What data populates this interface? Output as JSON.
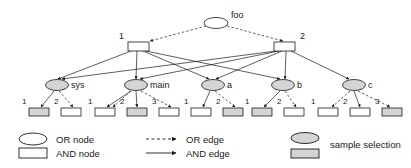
{
  "diagram": {
    "colors": {
      "stroke": "#1a1a1a",
      "node_fill": "#ffffff",
      "selected_fill": "#d4d4d4",
      "background": "#ffffff"
    },
    "root": {
      "label": "foo",
      "type": "or-node",
      "selected": false,
      "cx": 216,
      "cy": 23,
      "rx": 12,
      "ry": 5.5
    },
    "and_nodes": [
      {
        "label": "1",
        "type": "and-node",
        "selected": false,
        "x": 128,
        "y": 42,
        "w": 21,
        "h": 9,
        "label_x": 119,
        "label_y": 39
      },
      {
        "label": "2",
        "type": "and-node",
        "selected": false,
        "x": 274,
        "y": 42,
        "w": 21,
        "h": 9,
        "label_x": 300,
        "label_y": 39
      }
    ],
    "or_nodes": [
      {
        "label": "sys",
        "type": "or-node",
        "selected": true,
        "cx": 57,
        "cy": 85,
        "rx": 11.5,
        "ry": 5.5,
        "label_x": 71,
        "label_y": 88
      },
      {
        "label": "main",
        "type": "or-node",
        "selected": true,
        "cx": 136,
        "cy": 85,
        "rx": 11.5,
        "ry": 5.5,
        "label_x": 150,
        "label_y": 88
      },
      {
        "label": "a",
        "type": "or-node",
        "selected": true,
        "cx": 213,
        "cy": 85,
        "rx": 11.5,
        "ry": 5.5,
        "label_x": 227,
        "label_y": 88
      },
      {
        "label": "b",
        "type": "or-node",
        "selected": true,
        "cx": 283,
        "cy": 85,
        "rx": 11.5,
        "ry": 5.5,
        "label_x": 297,
        "label_y": 88
      },
      {
        "label": "c",
        "type": "or-node",
        "selected": true,
        "cx": 354,
        "cy": 85,
        "rx": 11.5,
        "ry": 5.5,
        "label_x": 368,
        "label_y": 88
      }
    ],
    "leaf_groups": [
      {
        "parent": "sys",
        "leaves": [
          {
            "label": "1",
            "selected": true,
            "x": 29,
            "y": 108,
            "w": 20,
            "h": 8,
            "label_x": 22,
            "label_y": 104
          },
          {
            "label": "2",
            "selected": false,
            "x": 61,
            "y": 108,
            "w": 20,
            "h": 8,
            "label_x": 54,
            "label_y": 104
          }
        ]
      },
      {
        "parent": "main",
        "leaves": [
          {
            "label": "1",
            "selected": false,
            "x": 95,
            "y": 108,
            "w": 20,
            "h": 8,
            "label_x": 88,
            "label_y": 104
          },
          {
            "label": "2",
            "selected": true,
            "x": 127,
            "y": 108,
            "w": 20,
            "h": 8,
            "label_x": 120,
            "label_y": 104
          },
          {
            "label": "3",
            "selected": false,
            "x": 159,
            "y": 108,
            "w": 20,
            "h": 8,
            "label_x": 152,
            "label_y": 104
          }
        ]
      },
      {
        "parent": "a",
        "leaves": [
          {
            "label": "1",
            "selected": false,
            "x": 191,
            "y": 108,
            "w": 20,
            "h": 8,
            "label_x": 184,
            "label_y": 104
          },
          {
            "label": "2",
            "selected": true,
            "x": 223,
            "y": 108,
            "w": 20,
            "h": 8,
            "label_x": 216,
            "label_y": 104
          }
        ]
      },
      {
        "parent": "b",
        "leaves": [
          {
            "label": "1",
            "selected": true,
            "x": 252,
            "y": 108,
            "w": 20,
            "h": 8,
            "label_x": 245,
            "label_y": 104
          },
          {
            "label": "2",
            "selected": false,
            "x": 284,
            "y": 108,
            "w": 20,
            "h": 8,
            "label_x": 277,
            "label_y": 104
          }
        ]
      },
      {
        "parent": "c",
        "leaves": [
          {
            "label": "1",
            "selected": false,
            "x": 318,
            "y": 108,
            "w": 20,
            "h": 8,
            "label_x": 311,
            "label_y": 104
          },
          {
            "label": "2",
            "selected": false,
            "x": 350,
            "y": 108,
            "w": 20,
            "h": 8,
            "label_x": 343,
            "label_y": 104
          },
          {
            "label": "3",
            "selected": true,
            "x": 382,
            "y": 108,
            "w": 20,
            "h": 8,
            "label_x": 375,
            "label_y": 104
          }
        ]
      }
    ],
    "edges": {
      "or_edges": [
        {
          "from": "foo",
          "to": "and-1",
          "x1": 206,
          "y1": 26,
          "x2": 150,
          "y2": 41
        },
        {
          "from": "foo",
          "to": "and-2",
          "x1": 227,
          "y1": 26,
          "x2": 283,
          "y2": 41
        },
        {
          "from": "sys",
          "to": "sys-2",
          "x1": 59,
          "y1": 91,
          "x2": 73,
          "y2": 107
        },
        {
          "from": "main",
          "to": "main-2",
          "x1": 131,
          "y1": 91,
          "x2": 113,
          "y2": 107
        },
        {
          "from": "main",
          "to": "main-3",
          "x1": 141,
          "y1": 91,
          "x2": 171,
          "y2": 107
        },
        {
          "from": "a",
          "to": "a-2",
          "x1": 215,
          "y1": 91,
          "x2": 235,
          "y2": 107
        },
        {
          "from": "b",
          "to": "b-2",
          "x1": 285,
          "y1": 91,
          "x2": 296,
          "y2": 107
        },
        {
          "from": "c",
          "to": "c-1",
          "x1": 350,
          "y1": 91,
          "x2": 332,
          "y2": 107
        },
        {
          "from": "c",
          "to": "c-3",
          "x1": 358,
          "y1": 91,
          "x2": 390,
          "y2": 107
        }
      ],
      "and_edges": [
        {
          "from": "and-1",
          "to": "sys",
          "x1": 131,
          "y1": 51,
          "x2": 58,
          "y2": 79
        },
        {
          "from": "and-1",
          "to": "main",
          "x1": 137,
          "y1": 51,
          "x2": 136,
          "y2": 79
        },
        {
          "from": "and-1",
          "to": "a",
          "x1": 143,
          "y1": 51,
          "x2": 209,
          "y2": 79
        },
        {
          "from": "and-1",
          "to": "b",
          "x1": 146,
          "y1": 51,
          "x2": 280,
          "y2": 79
        },
        {
          "from": "and-2",
          "to": "sys",
          "x1": 276,
          "y1": 51,
          "x2": 62,
          "y2": 79
        },
        {
          "from": "and-2",
          "to": "main",
          "x1": 279,
          "y1": 51,
          "x2": 140,
          "y2": 79
        },
        {
          "from": "and-2",
          "to": "a",
          "x1": 282,
          "y1": 51,
          "x2": 216,
          "y2": 79
        },
        {
          "from": "and-2",
          "to": "b",
          "x1": 286,
          "y1": 51,
          "x2": 285,
          "y2": 79
        },
        {
          "from": "and-2",
          "to": "c",
          "x1": 291,
          "y1": 51,
          "x2": 349,
          "y2": 79
        },
        {
          "from": "sys",
          "to": "sys-1",
          "x1": 54,
          "y1": 91,
          "x2": 41,
          "y2": 107
        },
        {
          "from": "main",
          "to": "main-1",
          "x1": 131,
          "y1": 91,
          "x2": 107,
          "y2": 107
        },
        {
          "from": "main",
          "to": "main-2",
          "x1": 136,
          "y1": 91,
          "x2": 137,
          "y2": 107
        },
        {
          "from": "a",
          "to": "a-1",
          "x1": 210,
          "y1": 91,
          "x2": 203,
          "y2": 107
        },
        {
          "from": "b",
          "to": "b-1",
          "x1": 280,
          "y1": 91,
          "x2": 264,
          "y2": 107
        },
        {
          "from": "c",
          "to": "c-2",
          "x1": 354,
          "y1": 91,
          "x2": 360,
          "y2": 107
        }
      ]
    }
  },
  "legend": {
    "column1": [
      {
        "key": "or-node",
        "label": "OR node",
        "shape": "ellipse",
        "selected": false
      },
      {
        "key": "and-node",
        "label": "AND node",
        "shape": "rectangle",
        "selected": false
      }
    ],
    "column2": [
      {
        "key": "or-edge",
        "label": "OR edge",
        "shape": "dashed-arrow",
        "selected": false
      },
      {
        "key": "and-edge",
        "label": "AND edge",
        "shape": "solid-arrow",
        "selected": false
      }
    ],
    "column3": [
      {
        "key": "sample-selection",
        "label": "sample selection",
        "shape": "ellipse-and-rectangle",
        "selected": true
      }
    ]
  }
}
